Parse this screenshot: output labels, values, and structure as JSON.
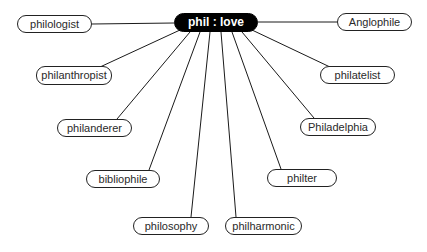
{
  "diagram": {
    "title": "phil : love",
    "center": {
      "label": "phil : love",
      "x": 174,
      "y": 13,
      "w": 84,
      "h": 19,
      "fill": "#000000",
      "text_color": "#ffffff"
    },
    "nodes": [
      {
        "id": "philologist",
        "label": "philologist",
        "x": 17,
        "y": 15,
        "w": 75,
        "h": 18,
        "anchor": [
          92,
          24
        ],
        "from": [
          174,
          23
        ]
      },
      {
        "id": "anglophile",
        "label": "Anglophile",
        "x": 337,
        "y": 13,
        "w": 75,
        "h": 18,
        "anchor": [
          337,
          22
        ],
        "from": [
          258,
          22
        ]
      },
      {
        "id": "philanthropist",
        "label": "philanthropist",
        "x": 36,
        "y": 66,
        "w": 76,
        "h": 19,
        "anchor": [
          100,
          67
        ],
        "from": [
          180,
          30
        ]
      },
      {
        "id": "philatelist",
        "label": "philatelist",
        "x": 320,
        "y": 66,
        "w": 75,
        "h": 18,
        "anchor": [
          330,
          67
        ],
        "from": [
          252,
          30
        ]
      },
      {
        "id": "philanderer",
        "label": "philanderer",
        "x": 57,
        "y": 119,
        "w": 75,
        "h": 18,
        "anchor": [
          117,
          119
        ],
        "from": [
          190,
          32
        ]
      },
      {
        "id": "philadelphia",
        "label": "Philadelphia",
        "x": 300,
        "y": 118,
        "w": 76,
        "h": 18,
        "anchor": [
          314,
          118
        ],
        "from": [
          242,
          32
        ]
      },
      {
        "id": "bibliophile",
        "label": "bibliophile",
        "x": 86,
        "y": 170,
        "w": 74,
        "h": 18,
        "anchor": [
          149,
          170
        ],
        "from": [
          200,
          32
        ]
      },
      {
        "id": "philter",
        "label": "philter",
        "x": 267,
        "y": 169,
        "w": 70,
        "h": 18,
        "anchor": [
          281,
          169
        ],
        "from": [
          232,
          32
        ]
      },
      {
        "id": "philosophy",
        "label": "philosophy",
        "x": 133,
        "y": 217,
        "w": 76,
        "h": 18,
        "anchor": [
          191,
          217
        ],
        "from": [
          210,
          32
        ]
      },
      {
        "id": "philharmonic",
        "label": "philharmonic",
        "x": 225,
        "y": 217,
        "w": 77,
        "h": 18,
        "anchor": [
          236,
          217
        ],
        "from": [
          221,
          32
        ]
      }
    ],
    "line_color": "#1a1a1a",
    "node_border_color": "#222222"
  }
}
